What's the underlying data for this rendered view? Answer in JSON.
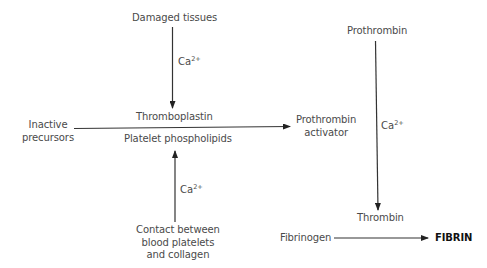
{
  "diagram": {
    "type": "flowchart",
    "title": "",
    "nodes": {
      "damaged_tissues": "Damaged tissues",
      "thromboplastin": "Thromboplastin",
      "inactive_precursors_line1": "Inactive",
      "inactive_precursors_line2": "precursors",
      "platelet_phospholipids": "Platelet phospholipids",
      "contact_line1": "Contact between",
      "contact_line2": "blood platelets",
      "contact_line3": "and collagen",
      "prothrombin_activator_line1": "Prothrombin",
      "prothrombin_activator_line2": "activator",
      "prothrombin": "Prothrombin",
      "thrombin": "Thrombin",
      "fibrinogen": "Fibrinogen",
      "fibrin": "FIBRIN"
    },
    "cofactor": {
      "base": "Ca",
      "charge": "2+"
    },
    "edges": [
      {
        "from": "Damaged tissues",
        "to": "Thromboplastin",
        "label": "Ca2+"
      },
      {
        "from": "Contact between blood platelets and collagen",
        "to": "Platelet phospholipids",
        "label": "Ca2+"
      },
      {
        "from": "Inactive precursors",
        "to": "Prothrombin activator",
        "label": "Thromboplastin / Platelet phospholipids"
      },
      {
        "from": "Prothrombin",
        "to": "Thrombin",
        "label": "Ca2+"
      },
      {
        "from": "Fibrinogen",
        "to": "FIBRIN",
        "label": ""
      }
    ],
    "colors": {
      "line": "#333333",
      "text": "#4a4a4a",
      "emphasis": "#111111"
    }
  }
}
